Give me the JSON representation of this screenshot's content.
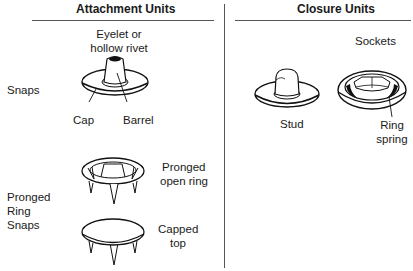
{
  "columns": {
    "left": {
      "heading": "Attachment Units"
    },
    "right": {
      "heading": "Closure Units"
    }
  },
  "rows": {
    "snaps": {
      "label": "Snaps"
    },
    "pronged": {
      "label_lines": [
        "Pronged",
        "Ring",
        "Snaps"
      ]
    }
  },
  "parts": {
    "eyelet": {
      "label_lines": [
        "Eyelet or",
        "hollow rivet"
      ]
    },
    "cap": {
      "label": "Cap"
    },
    "barrel": {
      "label": "Barrel"
    },
    "stud": {
      "label": "Stud"
    },
    "sockets": {
      "label": "Sockets"
    },
    "ring_spring": {
      "label_lines": [
        "Ring",
        "spring"
      ]
    },
    "pronged_open_ring": {
      "label_lines": [
        "Pronged",
        "open ring"
      ]
    },
    "capped_top": {
      "label_lines": [
        "Capped",
        "top"
      ]
    }
  }
}
